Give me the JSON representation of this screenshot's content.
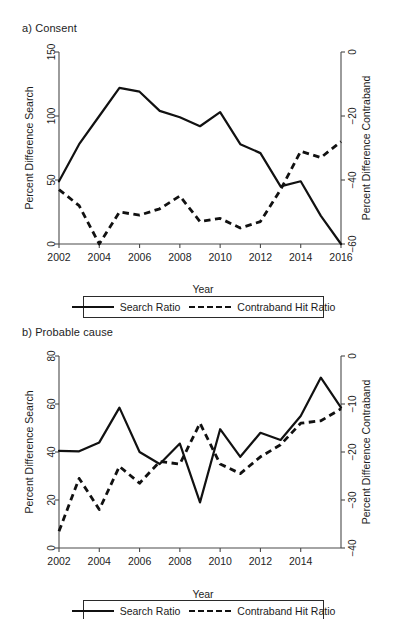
{
  "figure": {
    "panels": [
      {
        "id": "a",
        "title": "a) Consent"
      },
      {
        "id": "b",
        "title": "b) Probable cause"
      }
    ]
  },
  "legend": {
    "search_label": "Search Ratio",
    "contraband_label": "Contraband Hit Ratio"
  },
  "axis_titles": {
    "x": "Year",
    "y_left": "Percent Difference Search",
    "y_right": "Percent Difference Contraband"
  },
  "chart_data": [
    {
      "type": "line",
      "title": "a) Consent",
      "xlabel": "Year",
      "ylabel": "Percent Difference Search",
      "y2label": "Percent Difference Contraband",
      "xlim": [
        2002,
        2016
      ],
      "ylim": [
        0,
        150
      ],
      "y2lim": [
        -60,
        0
      ],
      "xticks": [
        2002,
        2004,
        2006,
        2008,
        2010,
        2012,
        2014,
        2016
      ],
      "yticks": [
        0,
        50,
        100,
        150
      ],
      "y2ticks": [
        0,
        -20,
        -40,
        -60
      ],
      "grid": false,
      "legend_position": "below",
      "x": [
        2002,
        2003,
        2004,
        2005,
        2006,
        2007,
        2008,
        2009,
        2010,
        2011,
        2012,
        2013,
        2014,
        2015,
        2016
      ],
      "series": [
        {
          "name": "Search Ratio",
          "axis": "left",
          "style": "solid",
          "values": [
            49,
            78,
            100,
            122,
            119,
            104,
            99,
            92,
            103,
            78,
            71,
            45,
            49,
            22,
            0
          ]
        },
        {
          "name": "Contraband Hit Ratio",
          "axis": "right",
          "style": "dashed",
          "values": [
            -43,
            -48,
            -60,
            -50,
            -51,
            -49,
            -45,
            -53,
            -52,
            -55,
            -53,
            -43,
            -31,
            -33,
            -28
          ]
        }
      ]
    },
    {
      "type": "line",
      "title": "b) Probable cause",
      "xlabel": "Year",
      "ylabel": "Percent Difference Search",
      "y2label": "Percent Difference Contraband",
      "xlim": [
        2002,
        2015
      ],
      "ylim": [
        0,
        80
      ],
      "y2lim": [
        -40,
        0
      ],
      "xticks": [
        2002,
        2004,
        2006,
        2008,
        2010,
        2012,
        2014
      ],
      "yticks": [
        0,
        20,
        40,
        60,
        80
      ],
      "y2ticks": [
        0,
        -10,
        -20,
        -30,
        -40
      ],
      "grid": false,
      "legend_position": "below",
      "x": [
        2002,
        2003,
        2004,
        2005,
        2006,
        2007,
        2008,
        2009,
        2010,
        2011,
        2012,
        2013,
        2014,
        2015,
        2016
      ],
      "series": [
        {
          "name": "Search Ratio",
          "axis": "left",
          "style": "solid",
          "values": [
            40.5,
            40.3,
            44,
            58.5,
            40,
            35,
            43.5,
            19,
            49.5,
            38,
            48,
            45,
            55,
            71,
            58.5
          ]
        },
        {
          "name": "Contraband Hit Ratio",
          "axis": "right",
          "style": "dashed",
          "values": [
            -36.5,
            -25.5,
            -32,
            -23,
            -26.5,
            -22,
            -22.5,
            -14,
            -22.5,
            -24.5,
            -21,
            -18.5,
            -14,
            -13.5,
            -11
          ]
        }
      ]
    }
  ]
}
